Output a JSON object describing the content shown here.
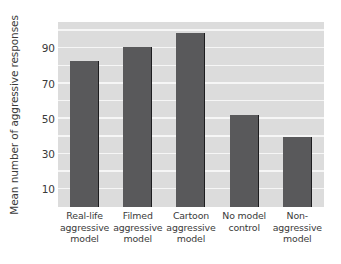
{
  "chart_data": {
    "type": "bar",
    "title": "",
    "xlabel": "",
    "ylabel": "Mean number of aggressive responses",
    "categories": [
      "Real-life aggressive model",
      "Filmed aggressive model",
      "Cartoon aggressive model",
      "No model control",
      "Non-aggressive model"
    ],
    "category_lines": [
      [
        "Real-life",
        "aggressive",
        "model"
      ],
      [
        "Filmed",
        "aggressive",
        "model"
      ],
      [
        "Cartoon",
        "aggressive",
        "model"
      ],
      [
        "No model",
        "control"
      ],
      [
        "Non-",
        "aggressive",
        "model"
      ]
    ],
    "values": [
      83,
      91,
      99,
      52,
      40
    ],
    "ylim": [
      0,
      105
    ],
    "yticks": [
      10,
      30,
      50,
      70,
      90
    ],
    "ytick_labels": [
      "90",
      "70",
      "50",
      "30",
      "10"
    ],
    "gridlines": [
      10,
      20,
      30,
      40,
      50,
      60,
      70,
      80,
      90,
      100
    ],
    "grid": true,
    "legend": "none",
    "colors": {
      "bar_fill": "#59595b",
      "bar_edge": "#1d1d1f",
      "plot_background": "#dcdcdc",
      "gridline": "#f6f6f6",
      "text": "#3a3a3a",
      "figure_background": "#ffffff"
    }
  }
}
